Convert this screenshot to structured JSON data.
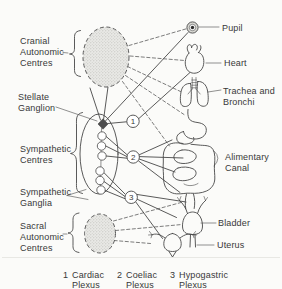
{
  "left_labels": {
    "cranial": {
      "lines": [
        "Cranial",
        "Autonomic",
        "Centres"
      ]
    },
    "stellate": {
      "lines": [
        "Stellate",
        "Ganglion"
      ]
    },
    "sympathetic_centres": {
      "lines": [
        "Sympathetic",
        "Centres"
      ]
    },
    "sympathetic_ganglia": {
      "lines": [
        "Sympathetic",
        "Ganglia"
      ]
    },
    "sacral": {
      "lines": [
        "Sacral",
        "Autonomic",
        "Centres"
      ]
    }
  },
  "organs": {
    "pupil": {
      "label": "Pupil"
    },
    "heart": {
      "label": "Heart"
    },
    "trachea_bronchi": {
      "lines": [
        "Trachea and",
        "Bronchi"
      ]
    },
    "alimentary_canal": {
      "lines": [
        "Alimentary",
        "Canal"
      ]
    },
    "bladder": {
      "label": "Bladder"
    },
    "uterus": {
      "label": "Uterus"
    }
  },
  "plexus_nodes": [
    {
      "number": "1"
    },
    {
      "number": "2"
    },
    {
      "number": "3"
    }
  ],
  "legend": {
    "items": [
      {
        "number": "1",
        "name": "Cardiac",
        "type": "Plexus"
      },
      {
        "number": "2",
        "name": "Coeliac",
        "type": "Plexus"
      },
      {
        "number": "3",
        "name": "Hypogastric",
        "type": "Plexus"
      }
    ]
  },
  "colors": {
    "background": "#fbfbf9",
    "line": "#474747",
    "dashed_line": "#5c5c5c",
    "text": "#383838",
    "stipple_fill": "#e9e9e6",
    "stipple_dot": "#b9b9b4",
    "node_fill": "#ffffff",
    "stellate_fill": "#4d4d4d",
    "pupil_ring": "#d8d8d3",
    "crease": "#e8e8e4"
  }
}
